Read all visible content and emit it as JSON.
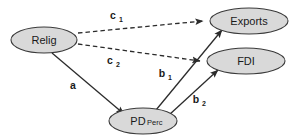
{
  "diagram": {
    "type": "path-mediation-diagram",
    "background_color": "#ffffff",
    "node_fill_color": "#d9d9d9",
    "node_stroke_color": "#3a3a3a",
    "edge_color": "#2b2b2b",
    "nodes": [
      {
        "id": "relig",
        "label": "Relig",
        "sublabel": "",
        "cx": 44,
        "cy": 40,
        "rx": 33,
        "ry": 13
      },
      {
        "id": "exports",
        "label": "Exports",
        "sublabel": "",
        "cx": 249,
        "cy": 21,
        "rx": 39,
        "ry": 13
      },
      {
        "id": "fdi",
        "label": "FDI",
        "sublabel": "",
        "cx": 246,
        "cy": 61,
        "rx": 39,
        "ry": 13
      },
      {
        "id": "pdperc",
        "label": "PD",
        "sublabel": "Perc",
        "cx": 143,
        "cy": 121,
        "rx": 34,
        "ry": 13
      }
    ],
    "edges": [
      {
        "id": "c1",
        "from": "relig",
        "to": "exports",
        "style": "dashed",
        "label": "c",
        "sublabel": "1",
        "label_x": 113,
        "label_y": 19
      },
      {
        "id": "c2",
        "from": "relig",
        "to": "fdi",
        "style": "dashed",
        "label": "c",
        "sublabel": "2",
        "label_x": 110,
        "label_y": 64
      },
      {
        "id": "a",
        "from": "relig",
        "to": "pdperc",
        "style": "solid",
        "label": "a",
        "sublabel": "",
        "label_x": 73,
        "label_y": 89
      },
      {
        "id": "b1",
        "from": "pdperc",
        "to": "exports",
        "style": "solid",
        "label": "b",
        "sublabel": "1",
        "label_x": 162,
        "label_y": 77
      },
      {
        "id": "b2",
        "from": "pdperc",
        "to": "fdi",
        "style": "solid",
        "label": "b",
        "sublabel": "2",
        "label_x": 196,
        "label_y": 103
      }
    ]
  }
}
